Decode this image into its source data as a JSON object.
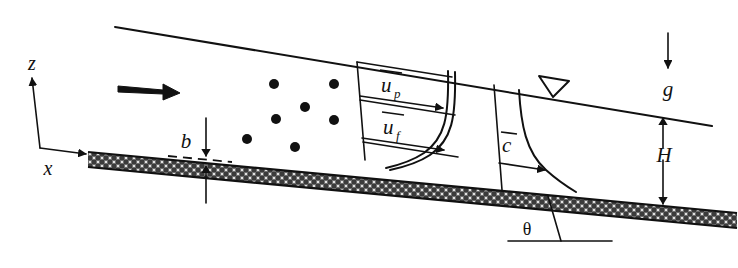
{
  "figure": {
    "labels": {
      "axis_z": "z",
      "axis_x": "x",
      "bed_thickness": "b",
      "velocity_particle": "u",
      "velocity_particle_sub": "p",
      "velocity_fluid": "u",
      "velocity_fluid_sub": "f",
      "concentration": "c",
      "flow_depth": "H",
      "gravity": "g",
      "slope_angle": "θ"
    },
    "icons": {
      "flow_direction": "flow-arrow-icon",
      "free_surface": "free-surface-triangle-icon",
      "gravity_vector": "gravity-arrow-icon",
      "depth_dimension": "depth-dimension-arrow-icon",
      "thickness_dimension": "thickness-dimension-arrow-icon",
      "velocity_vector_p": "velocity-arrow-p-icon",
      "velocity_vector_f": "velocity-arrow-f-icon",
      "concentration_vector": "concentration-arrow-icon"
    },
    "colors": {
      "ink": "#111111",
      "background": "#ffffff",
      "bed_fill": "#3b3b3b"
    },
    "particles": [
      {
        "cx": 274,
        "cy": 84,
        "r": 5
      },
      {
        "cx": 276,
        "cy": 119,
        "r": 5
      },
      {
        "cx": 305,
        "cy": 107,
        "r": 5
      },
      {
        "cx": 334,
        "cy": 120,
        "r": 5
      },
      {
        "cx": 247,
        "cy": 139,
        "r": 5
      },
      {
        "cx": 295,
        "cy": 147,
        "r": 5
      },
      {
        "cx": 334,
        "cy": 84,
        "r": 5
      }
    ]
  }
}
